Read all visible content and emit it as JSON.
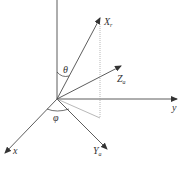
{
  "diagram": {
    "type": "3d-coordinate-frame",
    "colors": {
      "line": "#333333",
      "dotted": "#9a9a9a",
      "text": "#333333"
    },
    "axes": {
      "z_axis": {
        "label": ""
      },
      "y_axis": {
        "label": "y"
      },
      "x_axis": {
        "label": "x"
      }
    },
    "vectors": {
      "Xr": {
        "label": "X",
        "subscript": "r"
      },
      "Za": {
        "label": "Z",
        "subscript": "a"
      },
      "Ya": {
        "label": "Y",
        "subscript": "a"
      }
    },
    "angles": {
      "theta": "θ",
      "phi": "φ"
    }
  }
}
